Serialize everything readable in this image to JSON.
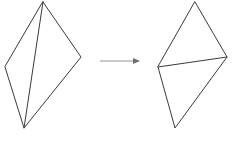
{
  "diagram": {
    "type": "geometry-diagonal-flip",
    "canvas": {
      "width": 237,
      "height": 143,
      "background": "#ffffff"
    },
    "stroke_color": "#3a3a42",
    "arrow_color": "#b9b9bd",
    "arrow_head_color": "#6d6d73",
    "shapes": [
      {
        "name": "left-quadrilateral",
        "label": "",
        "vertices": {
          "top": [
            43,
            2
          ],
          "right": [
            81,
            57
          ],
          "bottom": [
            24,
            128
          ],
          "left": [
            5,
            67
          ]
        },
        "outline_points": "43,2 81,57 24,128 5,67",
        "diagonal": {
          "from": [
            43,
            2
          ],
          "to": [
            24,
            128
          ],
          "orientation": "vertical"
        }
      },
      {
        "name": "right-quadrilateral",
        "label": "",
        "vertices": {
          "top": [
            195,
            2
          ],
          "right": [
            227,
            57
          ],
          "bottom": [
            175,
            128
          ],
          "left": [
            158,
            67
          ]
        },
        "outline_points": "195,2 227,57 175,128 158,67",
        "diagonal": {
          "from": [
            158,
            67
          ],
          "to": [
            227,
            57
          ],
          "orientation": "horizontal"
        }
      }
    ],
    "arrow": {
      "name": "transform-arrow",
      "label": "",
      "from": [
        100,
        61
      ],
      "to": [
        140,
        61
      ],
      "head_points": "140,61 133,58 133,64"
    }
  }
}
